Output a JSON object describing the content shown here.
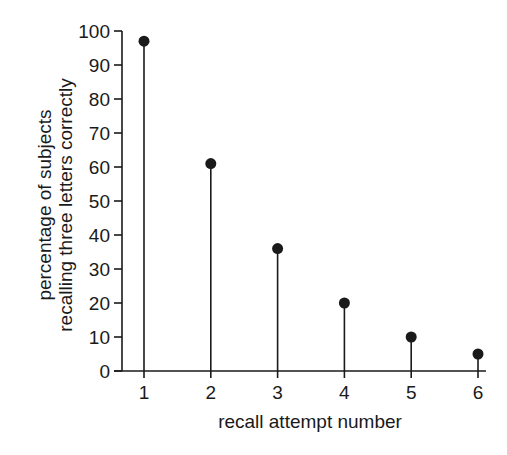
{
  "chart_data": {
    "type": "stem",
    "title": "",
    "xlabel": "recall attempt number",
    "ylabel_lines": [
      "percentage of subjects",
      "recalling three letters correctly"
    ],
    "ylabel": "percentage of subjects recalling three letters correctly",
    "categories": [
      "1",
      "2",
      "3",
      "4",
      "5",
      "6"
    ],
    "x": [
      1,
      2,
      3,
      4,
      5,
      6
    ],
    "values": [
      97,
      61,
      36,
      20,
      10,
      5
    ],
    "ylim": [
      0,
      100
    ],
    "yticks": [
      0,
      10,
      20,
      30,
      40,
      50,
      60,
      70,
      80,
      90,
      100
    ],
    "xticks": [
      1,
      2,
      3,
      4,
      5,
      6
    ],
    "grid": false,
    "legend": null,
    "colors": {
      "ink": "#1a1a1a",
      "background": "#ffffff"
    }
  }
}
